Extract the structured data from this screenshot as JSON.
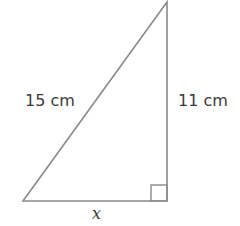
{
  "diagram": {
    "type": "right-triangle",
    "labels": {
      "hypotenuse": "15 cm",
      "vertical_leg": "11 cm",
      "horizontal_leg": "x"
    },
    "colors": {
      "stroke": "#8a8a8a",
      "text": "#3a3a3a"
    }
  }
}
